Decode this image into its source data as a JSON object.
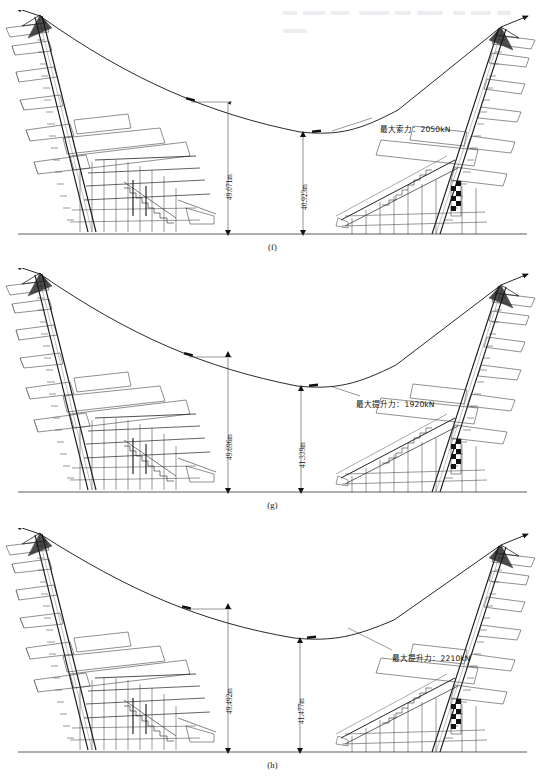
{
  "figure": {
    "domain": "engineering-elevation-drawing",
    "panel_count": 3,
    "header_strip": "cropped-running-header"
  },
  "panels": [
    {
      "id": "f",
      "caption": "(f)",
      "force_label": "最大索力：2050kN",
      "force_value_kn": 2050,
      "force_type": "最大索力",
      "dim_left": "49.071m",
      "dim_right": "40.923m",
      "dim_left_value_m": 49.071,
      "dim_right_value_m": 40.923
    },
    {
      "id": "g",
      "caption": "(g)",
      "force_label": "最大提升力：1920kN",
      "force_value_kn": 1920,
      "force_type": "最大提升力",
      "dim_left": "49.696m",
      "dim_right": "41.339m",
      "dim_left_value_m": 49.696,
      "dim_right_value_m": 41.339
    },
    {
      "id": "h",
      "caption": "(h)",
      "force_label": "最大提升力：2210kN",
      "force_value_kn": 2210,
      "force_type": "最大提升力",
      "dim_left": "49.492m",
      "dim_right": "41.477m",
      "dim_left_value_m": 49.492,
      "dim_right_value_m": 41.477
    }
  ],
  "colors": {
    "line": "#1a1a1a",
    "thin_line": "#4a4a4a",
    "ground": "#333333",
    "background": "#ffffff",
    "fill_dark": "#111111"
  }
}
